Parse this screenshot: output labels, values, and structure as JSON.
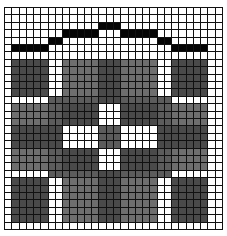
{
  "chart": {
    "title": "",
    "columns": 30,
    "rows": 30,
    "legend": {
      ".": "white",
      "k": "black",
      "g": "gray",
      "m": "medium-dark gray",
      "d": "dark gray"
    },
    "colors": {
      ".": "#ffffff",
      "k": "#050505",
      "g": "#6e6e6e",
      "m": "#5c5c5c",
      "d": "#4a4a4a",
      "gridline": "#111111"
    },
    "pattern": [
      "..............................",
      "..............................",
      ".............kkk..............",
      "........kkkkk...kkkkk.........",
      "......kk.............kk.......",
      ".kkkkk.................kkkkk..",
      "..............................",
      ".ddddd..gggggdddggggg..ddddd..",
      ".ddddd..gggggdddggggg..ddddd..",
      ".ddddd..gggggdddggggg..ddddd..",
      ".ddddd..gggggdddggggg..ddddd..",
      ".ddddd..gggggdddggggg..ddddd..",
      "......mmmmmmmdddmmmmmmm.......",
      ".gggggmmddddd...dddddmmggggg..",
      ".gggggmmddddd...dddddmmggggg..",
      ".gggggmmddddd...dddddmmggggg..",
      ".ddddddd.....mmm.....ddddddd..",
      ".ddddddd.....mmm.....ddddddd..",
      ".ddddddd.....mmm.....ddddddd..",
      ".gggggmmddddd...dddddmmggggg..",
      ".gggggmmddddd...dddddmmggggg..",
      ".gggggmmddddd...dddddmmggggg..",
      "......mmmmmmmdddmmmmmmm.......",
      ".ddddd..gggggdddggggg..ddddd..",
      ".ddddd..gggggdddggggg..ddddd..",
      ".ddddd..gggggdddggggg..ddddd..",
      ".ddddd..gggggdddggggg..ddddd..",
      ".ddddd..gggggdddggggg..ddddd..",
      ".ddddd..gggggdddggggg..ddddd..",
      ".............................."
    ]
  }
}
